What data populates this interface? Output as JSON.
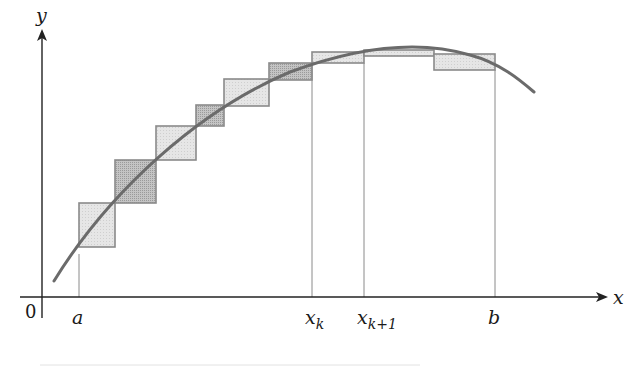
{
  "diagram": {
    "axes": {
      "x_label": "x",
      "y_label": "y",
      "origin_label": "0",
      "color": "#222222"
    },
    "ticks": [
      {
        "id": "a",
        "label": "a",
        "sub": "",
        "x": 79,
        "top": 254
      },
      {
        "id": "xk",
        "label": "x",
        "sub": "k",
        "x": 312,
        "top": 63
      },
      {
        "id": "xk1",
        "label": "x",
        "sub": "k+1",
        "x": 364,
        "top": 63
      },
      {
        "id": "b",
        "label": "b",
        "sub": "",
        "x": 495,
        "top": 70
      }
    ],
    "curve": {
      "color": "#6b6b6b",
      "stroke_width": 3,
      "path": "M54,281 C110,190 200,110 290,72 C360,46 420,40 470,55 C500,63 520,80 534,92"
    },
    "rectangles": [
      {
        "x": 79,
        "y": 203,
        "w": 36,
        "h": 44,
        "shade": "light"
      },
      {
        "x": 115,
        "y": 160,
        "w": 41,
        "h": 43,
        "shade": "dark"
      },
      {
        "x": 156,
        "y": 126,
        "w": 40,
        "h": 34,
        "shade": "light"
      },
      {
        "x": 196,
        "y": 105,
        "w": 28,
        "h": 21,
        "shade": "dark"
      },
      {
        "x": 224,
        "y": 79,
        "w": 45,
        "h": 27,
        "shade": "light"
      },
      {
        "x": 269,
        "y": 63,
        "w": 43,
        "h": 17,
        "shade": "dark"
      },
      {
        "x": 312,
        "y": 52,
        "w": 52,
        "h": 11,
        "shade": "light"
      },
      {
        "x": 364,
        "y": 50,
        "w": 70,
        "h": 6,
        "shade": "light"
      },
      {
        "x": 434,
        "y": 54,
        "w": 61,
        "h": 16,
        "shade": "light"
      }
    ],
    "colors": {
      "light_fill": "#e4e4e4",
      "dark_fill": "#bdbdbd",
      "rect_stroke": "#8a8a8a",
      "tick_line": "#8a8a8a"
    }
  }
}
